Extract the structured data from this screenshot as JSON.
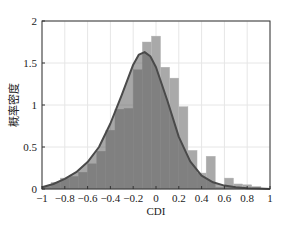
{
  "chart_data": {
    "type": "bar",
    "title": "",
    "xlabel": "CDI",
    "ylabel": "概率密度",
    "xlim": [
      -1,
      1
    ],
    "ylim": [
      0,
      2
    ],
    "grid": true,
    "legend": null,
    "x_ticks": [
      "-1",
      "-0.8",
      "-0.6",
      "-0.4",
      "-0.2",
      "0",
      "0.2",
      "0.4",
      "0.6",
      "0.8",
      "1"
    ],
    "y_ticks": [
      "0",
      "0.5",
      "1",
      "1.5",
      "2"
    ],
    "histogram": {
      "bin_width": 0.08,
      "bin_left_edges": [
        -1.0,
        -0.92,
        -0.84,
        -0.76,
        -0.68,
        -0.6,
        -0.52,
        -0.44,
        -0.36,
        -0.28,
        -0.2,
        -0.12,
        -0.04,
        0.04,
        0.12,
        0.2,
        0.28,
        0.36,
        0.44,
        0.52,
        0.6,
        0.68,
        0.76,
        0.84,
        0.92
      ],
      "density": [
        0.03,
        0.08,
        0.13,
        0.15,
        0.2,
        0.3,
        0.45,
        0.7,
        0.95,
        0.96,
        1.42,
        1.75,
        1.82,
        1.45,
        1.32,
        0.98,
        0.46,
        0.19,
        0.39,
        0.02,
        0.13,
        0.06,
        0.05,
        0.03,
        0.01
      ],
      "color": "#a9a9a9"
    },
    "series": [
      {
        "name": "fitted density curve",
        "type": "line",
        "color": "#4a4a4a",
        "x": [
          -1.0,
          -0.9,
          -0.8,
          -0.7,
          -0.6,
          -0.5,
          -0.4,
          -0.3,
          -0.2,
          -0.15,
          -0.1,
          -0.05,
          0.0,
          0.1,
          0.2,
          0.3,
          0.4,
          0.5,
          0.6,
          0.7,
          0.8,
          0.9,
          1.0
        ],
        "y": [
          0.02,
          0.06,
          0.12,
          0.2,
          0.32,
          0.5,
          0.78,
          1.12,
          1.48,
          1.6,
          1.63,
          1.58,
          1.45,
          1.05,
          0.62,
          0.33,
          0.16,
          0.08,
          0.04,
          0.02,
          0.01,
          0.005,
          0.0
        ]
      }
    ]
  }
}
